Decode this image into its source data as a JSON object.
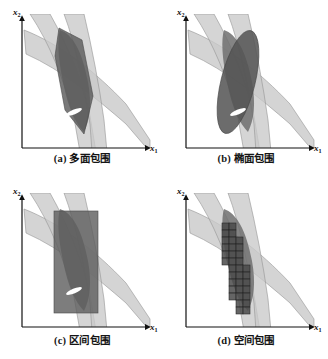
{
  "figure": {
    "title_implicit": "",
    "axis_labels": {
      "x": "x",
      "x_sub": "1",
      "y": "x",
      "y_sub": "2"
    },
    "panels": [
      {
        "id": "a",
        "caption": "(a) 多面包围",
        "enclosure": "polytope"
      },
      {
        "id": "b",
        "caption": "(b) 椭面包围",
        "enclosure": "ellipsoid"
      },
      {
        "id": "c",
        "caption": "(c) 区间包围",
        "enclosure": "interval-box"
      },
      {
        "id": "d",
        "caption": "(d) 空间包围",
        "enclosure": "subpaving-grid"
      }
    ]
  },
  "chart_data": {
    "type": "area",
    "title": "",
    "xlabel": "x1",
    "ylabel": "x2",
    "grid": false,
    "legend": null,
    "xlim": [
      0,
      164
    ],
    "ylim": [
      0,
      155
    ],
    "bands": [
      {
        "name": "band-1-steep-left",
        "fill": "#c9c9c9",
        "opacity": 0.75,
        "outline": "#8a8a8a",
        "upper_path": [
          [
            32,
            30
          ],
          [
            52,
            48
          ],
          [
            66,
            78
          ],
          [
            76,
            112
          ],
          [
            84,
            148
          ]
        ],
        "lower_path": [
          [
            52,
            30
          ],
          [
            70,
            50
          ],
          [
            82,
            82
          ],
          [
            90,
            116
          ],
          [
            98,
            148
          ]
        ]
      },
      {
        "name": "band-2-steep-right",
        "fill": "#c9c9c9",
        "opacity": 0.75,
        "outline": "#8a8a8a",
        "upper_path": [
          [
            62,
            30
          ],
          [
            74,
            52
          ],
          [
            82,
            84
          ],
          [
            88,
            116
          ],
          [
            93,
            148
          ]
        ],
        "lower_path": [
          [
            82,
            30
          ],
          [
            92,
            54
          ],
          [
            99,
            86
          ],
          [
            104,
            118
          ],
          [
            108,
            148
          ]
        ]
      },
      {
        "name": "band-3-wide-diagonal",
        "fill": "#c9c9c9",
        "opacity": 0.75,
        "outline": "#8a8a8a",
        "upper_path": [
          [
            24,
            32
          ],
          [
            60,
            48
          ],
          [
            95,
            74
          ],
          [
            125,
            106
          ],
          [
            148,
            140
          ]
        ],
        "lower_path": [
          [
            26,
            52
          ],
          [
            62,
            70
          ],
          [
            96,
            98
          ],
          [
            126,
            124
          ],
          [
            148,
            150
          ]
        ]
      }
    ],
    "intersection_region": {
      "name": "feasible-set",
      "fill": "#666666",
      "vertices": [
        [
          60,
          38
        ],
        [
          80,
          46
        ],
        [
          92,
          96
        ],
        [
          84,
          126
        ],
        [
          66,
          104
        ],
        [
          58,
          60
        ]
      ]
    },
    "solution_marker": {
      "name": "true-solution-ellipse",
      "fill": "#ffffff",
      "center": [
        74,
        112
      ],
      "rx": 8,
      "ry": 2.6,
      "rotation_deg": -22
    },
    "enclosures": {
      "polytope": {
        "fill": "#5a5a5a",
        "vertices": [
          [
            58,
            36
          ],
          [
            81,
            44
          ],
          [
            93,
            98
          ],
          [
            83,
            128
          ],
          [
            64,
            108
          ],
          [
            56,
            58
          ]
        ]
      },
      "ellipsoid": {
        "fill": "#4f4f4f",
        "center": [
          74,
          84
        ],
        "rx": 17,
        "ry": 52,
        "rotation_deg": 14
      },
      "interval_box": {
        "fill": "#5a5a5a",
        "x": 54,
        "y": 38,
        "width": 44,
        "height": 98
      },
      "subpaving_grid": {
        "fill": "#4a4a4a",
        "cell": 7,
        "cells": [
          [
            58,
            44
          ],
          [
            65,
            44
          ],
          [
            58,
            51
          ],
          [
            65,
            51
          ],
          [
            58,
            58
          ],
          [
            65,
            58
          ],
          [
            72,
            58
          ],
          [
            58,
            65
          ],
          [
            65,
            65
          ],
          [
            72,
            65
          ],
          [
            58,
            72
          ],
          [
            65,
            72
          ],
          [
            72,
            72
          ],
          [
            58,
            79
          ],
          [
            65,
            79
          ],
          [
            72,
            79
          ],
          [
            65,
            86
          ],
          [
            72,
            86
          ],
          [
            79,
            86
          ],
          [
            65,
            93
          ],
          [
            72,
            93
          ],
          [
            79,
            93
          ],
          [
            65,
            100
          ],
          [
            72,
            100
          ],
          [
            79,
            100
          ],
          [
            65,
            107
          ],
          [
            72,
            107
          ],
          [
            79,
            107
          ],
          [
            65,
            114
          ],
          [
            72,
            114
          ],
          [
            79,
            114
          ],
          [
            72,
            121
          ],
          [
            79,
            121
          ],
          [
            72,
            128
          ],
          [
            79,
            128
          ]
        ]
      }
    }
  }
}
